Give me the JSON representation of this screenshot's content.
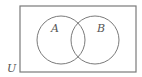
{
  "diagram": {
    "type": "venn",
    "universe": {
      "label": "U",
      "rect": {
        "x": 20,
        "y": 6,
        "width": 116,
        "height": 66
      }
    },
    "sets": [
      {
        "label": "A",
        "cx": 61,
        "cy": 40,
        "r": 24,
        "label_x": 51,
        "label_y": 32
      },
      {
        "label": "B",
        "cx": 95,
        "cy": 40,
        "r": 24,
        "label_x": 97,
        "label_y": 32
      }
    ],
    "colors": {
      "stroke": "#7a7a7a",
      "text": "#555555",
      "background": "#ffffff"
    }
  }
}
